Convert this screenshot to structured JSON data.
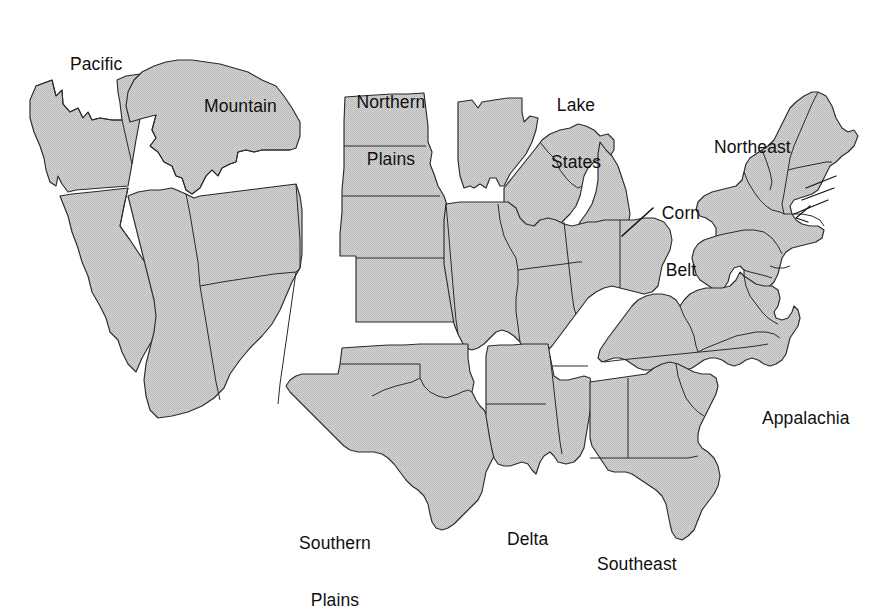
{
  "map": {
    "title": "Farm Production Regions of the United States",
    "type": "choropleth-outline",
    "background_color": "#ffffff",
    "region_fill_color": "#c9c9c9",
    "region_outline_color": "#2b2b2b",
    "label_text_color": "#101010",
    "region_count": 10,
    "regions": [
      {
        "id": "pacific",
        "label": "Pacific",
        "label_lines": [
          "Pacific"
        ],
        "label_x": 70,
        "label_y": 17,
        "states": [
          "Washington",
          "Oregon",
          "California"
        ]
      },
      {
        "id": "mountain",
        "label": "Mountain",
        "label_lines": [
          "Mountain"
        ],
        "label_x": 204,
        "label_y": 59,
        "states": [
          "Montana",
          "Idaho",
          "Wyoming",
          "Nevada",
          "Utah",
          "Colorado",
          "Arizona",
          "New Mexico"
        ]
      },
      {
        "id": "northern-plains",
        "label": "Northern Plains",
        "label_lines": [
          "Northern",
          "Plains"
        ],
        "label_x": 345,
        "label_y": 55,
        "states": [
          "North Dakota",
          "South Dakota",
          "Nebraska",
          "Kansas"
        ]
      },
      {
        "id": "lake-states",
        "label": "Lake States",
        "label_lines": [
          "Lake",
          "States"
        ],
        "label_x": 540,
        "label_y": 58,
        "states": [
          "Minnesota",
          "Wisconsin",
          "Michigan"
        ]
      },
      {
        "id": "corn-belt",
        "label": "Corn Belt",
        "label_lines": [
          "Corn",
          "Belt"
        ],
        "label_x": 654,
        "label_y": 166,
        "states": [
          "Iowa",
          "Missouri",
          "Illinois",
          "Indiana",
          "Ohio"
        ],
        "has_leader_line": true
      },
      {
        "id": "northeast",
        "label": "Northeast",
        "label_lines": [
          "Northeast"
        ],
        "label_x": 714,
        "label_y": 100,
        "states": [
          "Maine",
          "New Hampshire",
          "Vermont",
          "Massachusetts",
          "Rhode Island",
          "Connecticut",
          "New York",
          "Pennsylvania",
          "New Jersey",
          "Delaware",
          "Maryland"
        ],
        "has_leader_line": true
      },
      {
        "id": "appalachia",
        "label": "Appalachia",
        "label_lines": [
          "Appalachia"
        ],
        "label_x": 762,
        "label_y": 371,
        "states": [
          "Kentucky",
          "Tennessee",
          "West Virginia",
          "Virginia",
          "North Carolina"
        ]
      },
      {
        "id": "southern-plains",
        "label": "Southern Plains",
        "label_lines": [
          "Southern",
          "Plains"
        ],
        "label_x": 288,
        "label_y": 496,
        "states": [
          "Oklahoma",
          "Texas"
        ]
      },
      {
        "id": "delta",
        "label": "Delta",
        "label_lines": [
          "Delta"
        ],
        "label_x": 507,
        "label_y": 492,
        "states": [
          "Arkansas",
          "Louisiana",
          "Mississippi"
        ]
      },
      {
        "id": "southeast",
        "label": "Southeast",
        "label_lines": [
          "Southeast"
        ],
        "label_x": 597,
        "label_y": 517,
        "states": [
          "Alabama",
          "Georgia",
          "South Carolina",
          "Florida"
        ]
      }
    ]
  }
}
